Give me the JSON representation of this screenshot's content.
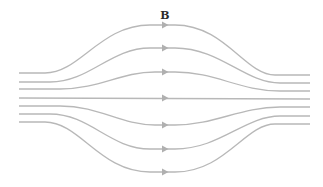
{
  "diagram": {
    "label": "B",
    "label_pos": {
      "x": 165,
      "y": 19
    },
    "line_color": "#b8b8b8",
    "arrow_color": "#b0b0b0",
    "lines": [
      {
        "name": "field-line-1",
        "d": "M19,73 L45,73 C80,73 100,25 150,25 L175,25 C225,25 245,75 275,75 L310,75",
        "arrow": {
          "x": 165,
          "y": 25
        }
      },
      {
        "name": "field-line-2",
        "d": "M19,82 L50,82 C90,82 110,48 150,48 L175,48 C220,48 245,83 280,83 L310,83",
        "arrow": {
          "x": 165,
          "y": 48
        }
      },
      {
        "name": "field-line-3",
        "d": "M19,89 L60,89 C100,89 120,72 155,72 L175,72 C215,72 240,91 280,91 L310,91",
        "arrow": {
          "x": 165,
          "y": 72
        }
      },
      {
        "name": "field-line-4",
        "d": "M19,98 L310,99",
        "arrow": {
          "x": 165,
          "y": 98
        }
      },
      {
        "name": "field-line-5",
        "d": "M19,106 L60,106 C100,106 120,125 155,125 L175,125 C215,125 240,107 280,107 L310,107",
        "arrow": {
          "x": 165,
          "y": 125
        }
      },
      {
        "name": "field-line-6",
        "d": "M19,114 L50,114 C90,114 110,149 150,149 L175,149 C220,149 245,116 280,116 L310,116",
        "arrow": {
          "x": 165,
          "y": 149
        }
      },
      {
        "name": "field-line-7",
        "d": "M19,122 L45,122 C80,122 100,172 150,172 L175,172 C225,172 245,124 275,124 L310,124",
        "arrow": {
          "x": 165,
          "y": 172
        }
      }
    ]
  }
}
